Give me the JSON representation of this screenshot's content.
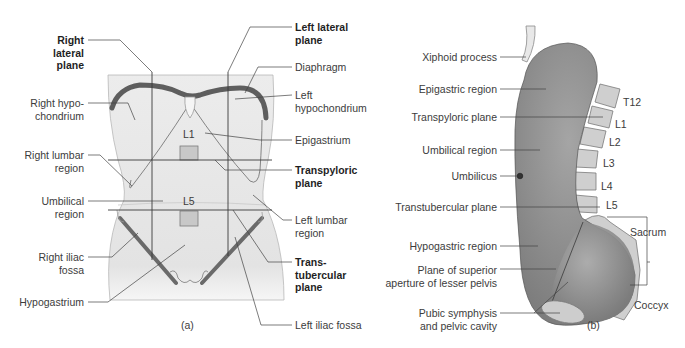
{
  "panel_a": {
    "caption": "(a)",
    "labels": {
      "right_lateral_plane": [
        "Right",
        "lateral",
        "plane"
      ],
      "right_hypochondrium": [
        "Right hypo-",
        "chondrium"
      ],
      "right_lumbar_region": [
        "Right lumbar",
        "region"
      ],
      "umbilical_region": [
        "Umbilical",
        "region"
      ],
      "right_iliac_fossa": [
        "Right iliac",
        "fossa"
      ],
      "hypogastrium": "Hypogastrium",
      "left_lateral_plane": [
        "Left lateral",
        "plane"
      ],
      "diaphragm": "Diaphragm",
      "left_hypochondrium": [
        "Left",
        "hypochondrium"
      ],
      "epigastrium": "Epigastrium",
      "transpyloric_plane": [
        "Transpyloric",
        "plane"
      ],
      "left_lumbar_region": [
        "Left lumbar",
        "region"
      ],
      "transtubercular_plane": [
        "Trans-",
        "tubercular",
        "plane"
      ],
      "left_iliac_fossa": "Left iliac fossa"
    },
    "vertebra_markers": {
      "upper": "L1",
      "lower": "L5"
    }
  },
  "panel_b": {
    "caption": "(b)",
    "left_labels": {
      "xiphoid_process": "Xiphoid process",
      "epigastric_region": "Epigastric region",
      "transpyloric_plane": "Transpyloric plane",
      "umbilical_region": "Umbilical region",
      "umbilicus": "Umbilicus",
      "transtubercular_plane": "Transtubercular plane",
      "hypogastric_region": "Hypogastric region",
      "plane_superior_aperture": [
        "Plane of superior",
        "aperture of lesser pelvis"
      ],
      "pubic_symphysis": [
        "Pubic symphysis",
        "and pelvic cavity"
      ]
    },
    "vertebrae": [
      "T12",
      "L1",
      "L2",
      "L3",
      "L4",
      "L5"
    ],
    "sacrum": "Sacrum",
    "coccyx": "Coccyx"
  },
  "colors": {
    "torso_fill": "#e6e6e6",
    "bone_dark": "#6e6e6e",
    "abdomen_fill": "#8c8c8c",
    "vertebra_fill": "#d0d0d0",
    "line": "#4a4a4a"
  }
}
